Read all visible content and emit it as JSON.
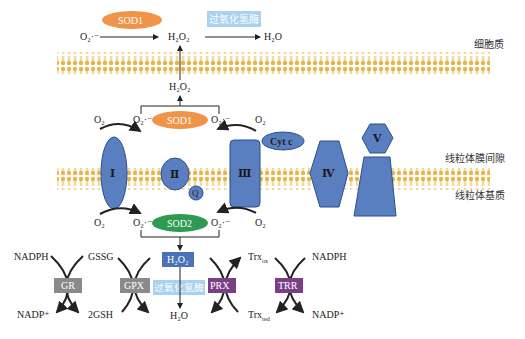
{
  "colors": {
    "membrane": "#e8b84a",
    "complex_fill": "#5a7fc0",
    "complex_stroke": "#2d4f8a",
    "sod1": "#f0944a",
    "sod2": "#2e9a52",
    "catalase_box": "#a9d2f0",
    "h2o2_box": "#4a72b8",
    "gray_enzyme": "#8a8a8a",
    "purple_enzyme": "#7b3f86"
  },
  "regions": {
    "cytoplasm": "细胞质",
    "intermembrane_space": "线粒体膜间隙",
    "matrix": "线粒体基质"
  },
  "cytoplasm_reaction": {
    "substrate": "O₂·⁻",
    "enzyme1": "SOD1",
    "intermediate": "H₂O₂",
    "enzyme2": "过氧化氢酶",
    "product": "H₂O"
  },
  "ims": {
    "h2o2": "H₂O₂",
    "enzyme": "SOD1",
    "o2_left": "O₂",
    "superoxide_left": "O₂·⁻",
    "superoxide_right": "O₂·⁻",
    "o2_right": "O₂"
  },
  "complexes": {
    "c1": "Ⅰ",
    "c2": "Ⅱ",
    "q": "Q",
    "c3": "Ⅲ",
    "cytc": "Cyt c",
    "c4": "Ⅳ",
    "c5": "Ⅴ"
  },
  "matrix": {
    "o2_left": "O₂",
    "superoxide_left": "O₂·⁻",
    "enzyme": "SOD2",
    "superoxide_right": "O₂·⁻",
    "o2_right": "O₂",
    "h2o2": "H₂O₂",
    "catalase": "过氧化氢酶",
    "h2o": "H₂O"
  },
  "antioxidant_cycles": {
    "gr": {
      "label": "GR",
      "top_left": "NADPH",
      "bottom_left": "NADP⁺"
    },
    "gpx": {
      "label": "GPX",
      "top_left": "GSSG",
      "bottom_left": "2GSH"
    },
    "prx": {
      "label": "PRX",
      "top_right": "Trxox",
      "bottom_right": "Trxred"
    },
    "trr": {
      "label": "TRR",
      "top_right": "NADPH",
      "bottom_right": "NADP⁺"
    },
    "trx_ox_base": "Trx",
    "trx_ox_sub": "ox",
    "trx_red_base": "Trx",
    "trx_red_sub": "red"
  }
}
